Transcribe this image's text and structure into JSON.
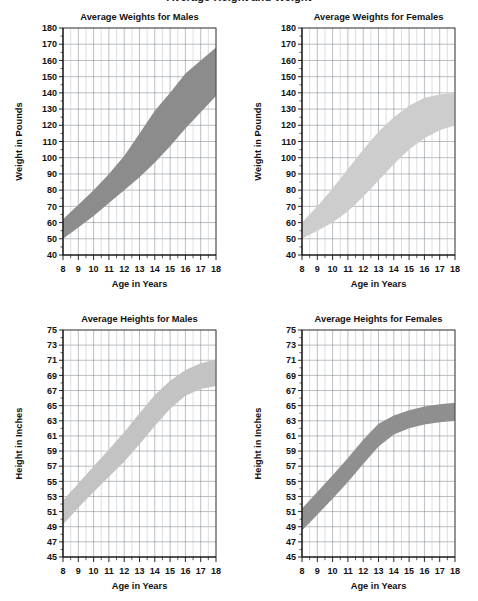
{
  "page": {
    "cut_off_header": "Average Height and Weight"
  },
  "charts": [
    {
      "id": "weights-males",
      "title": "Average Weights for Males",
      "xlabel": "Age in Years",
      "ylabel": "Weight in Pounds",
      "ylim": [
        40,
        180
      ],
      "ystep": 10,
      "yticks": [
        40,
        50,
        60,
        70,
        80,
        90,
        100,
        110,
        120,
        130,
        140,
        150,
        160,
        170,
        180
      ],
      "xlim": [
        8,
        18
      ],
      "xstep": 1,
      "xticks": [
        8,
        9,
        10,
        11,
        12,
        13,
        14,
        15,
        16,
        17,
        18
      ],
      "band_color": "#8c8c8c",
      "chart_data": {
        "type": "area",
        "title": "Average Weights for Males",
        "xlabel": "Age in Years",
        "ylabel": "Weight in Pounds",
        "ylim": [
          40,
          180
        ],
        "xlim": [
          8,
          18
        ],
        "grid": true,
        "legend": "none",
        "x": [
          8,
          9,
          10,
          11,
          12,
          13,
          14,
          15,
          16,
          17,
          18
        ],
        "series": [
          {
            "name": "upper",
            "values": [
              62,
              71,
              80,
              90,
              101,
              115,
              129,
              140,
              152,
              160,
              168
            ]
          },
          {
            "name": "lower",
            "values": [
              50,
              57,
              64,
              72,
              80,
              88,
              97,
              107,
              118,
              128,
              138
            ]
          }
        ]
      }
    },
    {
      "id": "weights-females",
      "title": "Average Weights for Females",
      "xlabel": "Age in Years",
      "ylabel": "Weight in Pounds",
      "ylim": [
        40,
        180
      ],
      "ystep": 10,
      "yticks": [
        40,
        50,
        60,
        70,
        80,
        90,
        100,
        110,
        120,
        130,
        140,
        150,
        160,
        170,
        180
      ],
      "xlim": [
        8,
        18
      ],
      "xstep": 1,
      "xticks": [
        8,
        9,
        10,
        11,
        12,
        13,
        14,
        15,
        16,
        17,
        18
      ],
      "band_color": "#cdcdcd",
      "chart_data": {
        "type": "area",
        "title": "Average Weights for Females",
        "xlabel": "Age in Years",
        "ylabel": "Weight in Pounds",
        "ylim": [
          40,
          180
        ],
        "xlim": [
          8,
          18
        ],
        "grid": true,
        "legend": "none",
        "x": [
          8,
          9,
          10,
          11,
          12,
          13,
          14,
          15,
          16,
          17,
          18
        ],
        "series": [
          {
            "name": "upper",
            "values": [
              60,
              70,
              81,
              93,
              105,
              116,
              125,
              132,
              137,
              139,
              140
            ]
          },
          {
            "name": "lower",
            "values": [
              50,
              55,
              60,
              67,
              76,
              86,
              96,
              105,
              112,
              117,
              120
            ]
          }
        ]
      }
    },
    {
      "id": "heights-males",
      "title": "Average Heights for Males",
      "xlabel": "Age in Years",
      "ylabel": "Height in Inches",
      "ylim": [
        45,
        75
      ],
      "ystep": 2,
      "yticks": [
        45,
        47,
        49,
        51,
        53,
        55,
        57,
        59,
        61,
        63,
        65,
        67,
        69,
        71,
        73,
        75
      ],
      "xlim": [
        8,
        18
      ],
      "xstep": 1,
      "xticks": [
        8,
        9,
        10,
        11,
        12,
        13,
        14,
        15,
        16,
        17,
        18
      ],
      "band_color": "#c3c3c3",
      "chart_data": {
        "type": "area",
        "title": "Average Heights for Males",
        "xlabel": "Age in Years",
        "ylabel": "Height in Inches",
        "ylim": [
          45,
          75
        ],
        "xlim": [
          8,
          18
        ],
        "grid": true,
        "legend": "none",
        "x": [
          8,
          9,
          10,
          11,
          12,
          13,
          14,
          15,
          16,
          17,
          18
        ],
        "series": [
          {
            "name": "upper",
            "values": [
              52.5,
              54.7,
              57.0,
              59.2,
              61.5,
              64.0,
              66.4,
              68.3,
              69.7,
              70.6,
              71.1
            ]
          },
          {
            "name": "lower",
            "values": [
              49.3,
              51.5,
              53.6,
              55.6,
              57.6,
              59.9,
              62.3,
              64.6,
              66.3,
              67.2,
              67.6
            ]
          }
        ]
      }
    },
    {
      "id": "heights-females",
      "title": "Average Heights for Females",
      "xlabel": "Age in Years",
      "ylabel": "Height in Inches",
      "ylim": [
        45,
        75
      ],
      "ystep": 2,
      "yticks": [
        45,
        47,
        49,
        51,
        53,
        55,
        57,
        59,
        61,
        63,
        65,
        67,
        69,
        71,
        73,
        75
      ],
      "xlim": [
        8,
        18
      ],
      "xstep": 1,
      "xticks": [
        8,
        9,
        10,
        11,
        12,
        13,
        14,
        15,
        16,
        17,
        18
      ],
      "band_color": "#8f8f8f",
      "chart_data": {
        "type": "area",
        "title": "Average Heights for Females",
        "xlabel": "Age in Years",
        "ylabel": "Height in Inches",
        "ylim": [
          45,
          75
        ],
        "xlim": [
          8,
          18
        ],
        "grid": true,
        "legend": "none",
        "x": [
          8,
          9,
          10,
          11,
          12,
          13,
          14,
          15,
          16,
          17,
          18
        ],
        "series": [
          {
            "name": "upper",
            "values": [
              51.4,
              53.6,
              55.8,
              58.1,
              60.5,
              62.6,
              63.7,
              64.4,
              64.9,
              65.2,
              65.4
            ]
          },
          {
            "name": "lower",
            "values": [
              48.5,
              50.6,
              52.7,
              54.9,
              57.3,
              59.6,
              61.2,
              62.0,
              62.5,
              62.8,
              63.0
            ]
          }
        ]
      }
    }
  ],
  "layout": {
    "positions": [
      {
        "left": 0,
        "top": 8
      },
      {
        "left": 239,
        "top": 8
      },
      {
        "left": 0,
        "top": 310
      },
      {
        "left": 239,
        "top": 310
      }
    ]
  }
}
